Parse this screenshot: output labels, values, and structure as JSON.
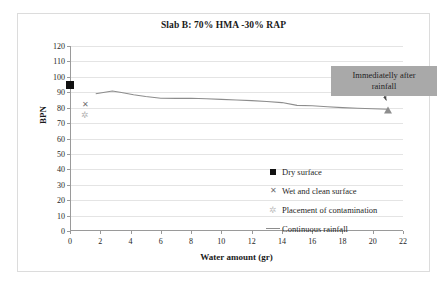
{
  "chart_data": {
    "type": "line",
    "title": "Slab B: 70% HMA -30% RAP",
    "xlabel": "Water amount  (gr)",
    "ylabel": "BPN",
    "xlim": [
      0,
      22
    ],
    "ylim": [
      0,
      120
    ],
    "xticks": [
      0,
      2,
      4,
      6,
      8,
      10,
      12,
      14,
      16,
      18,
      20,
      22
    ],
    "yticks": [
      0,
      10,
      20,
      30,
      40,
      50,
      60,
      70,
      80,
      90,
      100,
      110,
      120
    ],
    "grid": "horizontal",
    "legend_position": "inside-right",
    "series": [
      {
        "name": "Dry surface",
        "marker": "filled-square",
        "color": "#111111",
        "points": [
          {
            "x": 0,
            "y": 95
          }
        ]
      },
      {
        "name": "Wet and clean surface",
        "marker": "x-cross",
        "color": "#6f6f6f",
        "points": [
          {
            "x": 1,
            "y": 82
          }
        ]
      },
      {
        "name": "Placement of contamination",
        "marker": "plus-star",
        "color": "#b4b4b4",
        "points": [
          {
            "x": 1,
            "y": 75
          }
        ]
      },
      {
        "name": "Continuous rainfall",
        "marker": "line",
        "color": "#8d8d8d",
        "points": [
          {
            "x": 1.7,
            "y": 89.0
          },
          {
            "x": 2.2,
            "y": 89.8
          },
          {
            "x": 2.8,
            "y": 90.8
          },
          {
            "x": 3.4,
            "y": 89.8
          },
          {
            "x": 4.2,
            "y": 88.4
          },
          {
            "x": 5.0,
            "y": 87.2
          },
          {
            "x": 6.0,
            "y": 86.1
          },
          {
            "x": 7.0,
            "y": 86.0
          },
          {
            "x": 8.0,
            "y": 86.1
          },
          {
            "x": 9.0,
            "y": 85.8
          },
          {
            "x": 10.0,
            "y": 85.4
          },
          {
            "x": 11.0,
            "y": 85.0
          },
          {
            "x": 12.0,
            "y": 84.6
          },
          {
            "x": 13.0,
            "y": 84.0
          },
          {
            "x": 14.0,
            "y": 83.3
          },
          {
            "x": 15.0,
            "y": 81.5
          },
          {
            "x": 16.0,
            "y": 81.2
          },
          {
            "x": 17.0,
            "y": 80.6
          },
          {
            "x": 18.0,
            "y": 80.0
          },
          {
            "x": 19.0,
            "y": 79.6
          },
          {
            "x": 20.0,
            "y": 79.3
          },
          {
            "x": 21.0,
            "y": 79.0
          }
        ],
        "end_marker": {
          "x": 21.0,
          "y": 79.0,
          "shape": "triangle"
        }
      }
    ],
    "annotations": [
      {
        "text": "Immediatelly after rainfall",
        "box_color": "#a9a9a9",
        "target": {
          "x": 20.9,
          "y": 79.5
        }
      }
    ]
  },
  "legend": {
    "items": [
      {
        "label": "Dry surface",
        "key": "square-marker"
      },
      {
        "label": "Wet and clean surface",
        "key": "x-marker"
      },
      {
        "label": "Placement of contamination",
        "key": "plus-marker"
      },
      {
        "label": "Continuous rainfall",
        "key": "line-marker"
      }
    ]
  },
  "annotation": {
    "line1": "Immediatelly after",
    "line2": "rainfall"
  },
  "colors": {
    "grid": "#e4e4e4",
    "axis": "#9a9a9a",
    "series_line": "#8d8d8d",
    "annotation_box": "#a9a9a9",
    "frame": "#dcdcdc"
  }
}
